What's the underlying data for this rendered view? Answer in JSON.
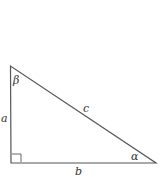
{
  "diagram": {
    "type": "right-triangle",
    "vertices": {
      "top": [
        10.5,
        66
      ],
      "right_angle": [
        11,
        163
      ],
      "right": [
        156,
        163
      ]
    },
    "labels": {
      "side_a": "a",
      "side_b": "b",
      "side_c": "c",
      "angle_alpha": "α",
      "angle_beta": "β"
    },
    "right_angle_marker": true,
    "colors": {
      "stroke": "#555555",
      "text": "#333333",
      "background": "#ffffff"
    }
  }
}
